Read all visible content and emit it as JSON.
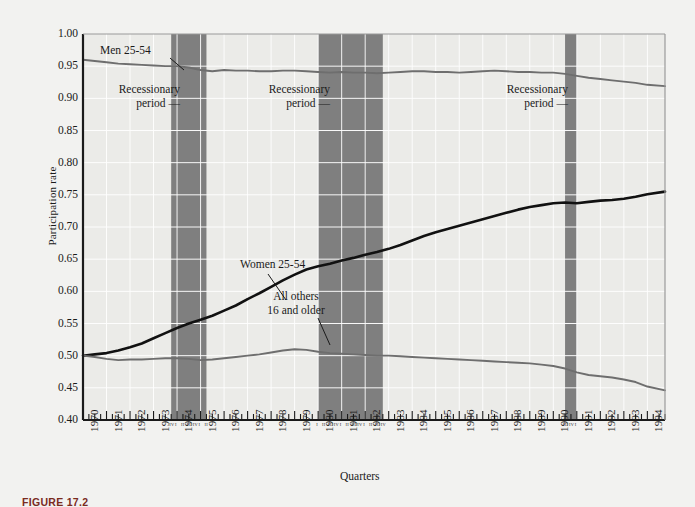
{
  "figure": {
    "caption": "FIGURE 17.2",
    "background_color": "#f2f2f0",
    "plot_background_color": "#ebebe8",
    "recession_band_color": "#7f7f7f",
    "axis_color": "#1a1a1a",
    "gridline_color": "#ffffff"
  },
  "annotations": [
    {
      "name": "men-series-label",
      "lines": [
        "Men 25-54"
      ],
      "align": "left"
    },
    {
      "name": "recession-label-1",
      "lines": [
        "Recessionary",
        "period —"
      ],
      "align": "right"
    },
    {
      "name": "recession-label-2",
      "lines": [
        "Recessionary",
        "period —"
      ],
      "align": "right"
    },
    {
      "name": "recession-label-3",
      "lines": [
        "Recessionary",
        "period —"
      ],
      "align": "right"
    },
    {
      "name": "women-series-label",
      "lines": [
        "Women 25-54"
      ],
      "align": "left"
    },
    {
      "name": "allothers-series-label",
      "lines": [
        "All others",
        "16 and older"
      ],
      "align": "center"
    }
  ],
  "quarter_marks": {
    "label_text": "I II III IV",
    "groups": [
      {
        "name": "quarters-1974",
        "text": "I  II III IV"
      },
      {
        "name": "quarters-1975",
        "text": "I  II III IV"
      },
      {
        "name": "quarters-1980",
        "text": "I  II III IV"
      },
      {
        "name": "quarters-1981",
        "text": "I  II III IV"
      },
      {
        "name": "quarters-1982",
        "text": "I  II III IV"
      },
      {
        "name": "quarters-1990",
        "text": "III IV"
      }
    ]
  },
  "chart_data": {
    "type": "line",
    "title": "",
    "xlabel": "Quarters",
    "ylabel": "Participation rate",
    "xlim": [
      1970.0,
      1994.75
    ],
    "ylim": [
      0.4,
      1.0
    ],
    "ytick_values": [
      0.4,
      0.45,
      0.5,
      0.55,
      0.6,
      0.65,
      0.7,
      0.75,
      0.8,
      0.85,
      0.9,
      0.95,
      1.0
    ],
    "ytick_labels": [
      "0.40",
      "0.45",
      "0.50",
      "0.55",
      "0.60",
      "0.65",
      "0.70",
      "0.75",
      "0.80",
      "0.85",
      "0.90",
      "0.95",
      "1.00"
    ],
    "xtick_labels": [
      "1970",
      "1971",
      "1972",
      "1973",
      "1974",
      "1975",
      "1976",
      "1977",
      "1978",
      "1979",
      "1980",
      "1981",
      "1982",
      "1983",
      "1984",
      "1985",
      "1986",
      "1987",
      "1988",
      "1989",
      "1990",
      "1991",
      "1992",
      "1993",
      "1994"
    ],
    "grid": true,
    "legend_position": "inline-annotations",
    "shaded_regions": [
      {
        "label": "Recessionary period",
        "x_start": 1973.75,
        "x_end": 1975.25
      },
      {
        "label": "Recessionary period",
        "x_start": 1980.0,
        "x_end": 1982.75
      },
      {
        "label": "Recessionary period",
        "x_start": 1990.5,
        "x_end": 1991.0
      }
    ],
    "series": [
      {
        "name": "Men 25-54",
        "color": "#6e6e6e",
        "x": [
          1970.0,
          1970.5,
          1971.0,
          1971.5,
          1972.0,
          1972.5,
          1973.0,
          1973.5,
          1974.0,
          1974.5,
          1975.0,
          1975.5,
          1976.0,
          1976.5,
          1977.0,
          1977.5,
          1978.0,
          1978.5,
          1979.0,
          1979.5,
          1980.0,
          1980.5,
          1981.0,
          1981.5,
          1982.0,
          1982.5,
          1983.0,
          1983.5,
          1984.0,
          1984.5,
          1985.0,
          1985.5,
          1986.0,
          1986.5,
          1987.0,
          1987.5,
          1988.0,
          1988.5,
          1989.0,
          1989.5,
          1990.0,
          1990.5,
          1991.0,
          1991.5,
          1992.0,
          1992.5,
          1993.0,
          1993.5,
          1994.0,
          1994.75
        ],
        "y": [
          0.96,
          0.958,
          0.956,
          0.954,
          0.953,
          0.952,
          0.951,
          0.95,
          0.95,
          0.948,
          0.944,
          0.942,
          0.944,
          0.943,
          0.943,
          0.942,
          0.942,
          0.943,
          0.943,
          0.942,
          0.941,
          0.94,
          0.941,
          0.94,
          0.94,
          0.939,
          0.94,
          0.941,
          0.942,
          0.942,
          0.941,
          0.941,
          0.94,
          0.941,
          0.942,
          0.943,
          0.942,
          0.941,
          0.941,
          0.94,
          0.94,
          0.938,
          0.935,
          0.932,
          0.93,
          0.928,
          0.926,
          0.924,
          0.921,
          0.919
        ]
      },
      {
        "name": "Women 25-54",
        "color": "#111111",
        "x": [
          1970.0,
          1970.5,
          1971.0,
          1971.5,
          1972.0,
          1972.5,
          1973.0,
          1973.5,
          1974.0,
          1974.5,
          1975.0,
          1975.5,
          1976.0,
          1976.5,
          1977.0,
          1977.5,
          1978.0,
          1978.5,
          1979.0,
          1979.5,
          1980.0,
          1980.5,
          1981.0,
          1981.5,
          1982.0,
          1982.5,
          1983.0,
          1983.5,
          1984.0,
          1984.5,
          1985.0,
          1985.5,
          1986.0,
          1986.5,
          1987.0,
          1987.5,
          1988.0,
          1988.5,
          1989.0,
          1989.5,
          1990.0,
          1990.5,
          1991.0,
          1991.5,
          1992.0,
          1992.5,
          1993.0,
          1993.5,
          1994.0,
          1994.75
        ],
        "y": [
          0.5,
          0.502,
          0.504,
          0.508,
          0.513,
          0.519,
          0.527,
          0.535,
          0.543,
          0.55,
          0.556,
          0.562,
          0.57,
          0.578,
          0.588,
          0.597,
          0.607,
          0.617,
          0.626,
          0.634,
          0.639,
          0.643,
          0.648,
          0.652,
          0.657,
          0.661,
          0.666,
          0.672,
          0.679,
          0.686,
          0.692,
          0.697,
          0.702,
          0.707,
          0.712,
          0.717,
          0.722,
          0.727,
          0.731,
          0.734,
          0.737,
          0.738,
          0.737,
          0.739,
          0.741,
          0.742,
          0.744,
          0.747,
          0.751,
          0.755
        ]
      },
      {
        "name": "All others 16 and older",
        "color": "#6e6e6e",
        "x": [
          1970.0,
          1970.5,
          1971.0,
          1971.5,
          1972.0,
          1972.5,
          1973.0,
          1973.5,
          1974.0,
          1974.5,
          1975.0,
          1975.5,
          1976.0,
          1976.5,
          1977.0,
          1977.5,
          1978.0,
          1978.5,
          1979.0,
          1979.5,
          1980.0,
          1980.5,
          1981.0,
          1981.5,
          1982.0,
          1982.5,
          1983.0,
          1983.5,
          1984.0,
          1984.5,
          1985.0,
          1985.5,
          1986.0,
          1986.5,
          1987.0,
          1987.5,
          1988.0,
          1988.5,
          1989.0,
          1989.5,
          1990.0,
          1990.5,
          1991.0,
          1991.5,
          1992.0,
          1992.5,
          1993.0,
          1993.5,
          1994.0,
          1994.75
        ],
        "y": [
          0.5,
          0.498,
          0.495,
          0.493,
          0.494,
          0.494,
          0.495,
          0.496,
          0.496,
          0.495,
          0.493,
          0.494,
          0.496,
          0.498,
          0.5,
          0.502,
          0.505,
          0.508,
          0.51,
          0.509,
          0.506,
          0.504,
          0.503,
          0.502,
          0.501,
          0.5,
          0.5,
          0.499,
          0.498,
          0.497,
          0.496,
          0.495,
          0.494,
          0.493,
          0.492,
          0.491,
          0.49,
          0.489,
          0.488,
          0.486,
          0.484,
          0.48,
          0.474,
          0.47,
          0.468,
          0.466,
          0.463,
          0.459,
          0.452,
          0.446
        ]
      }
    ]
  }
}
